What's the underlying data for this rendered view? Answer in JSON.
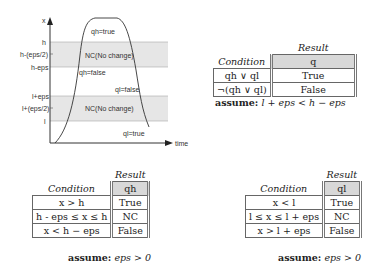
{
  "diagram": {
    "y_axis_label": "x",
    "x_axis_label": "time",
    "levels": [
      "h",
      "h-(eps/2)",
      "h-eps",
      "l+eps",
      "l+(eps/2)",
      "l"
    ],
    "band_labels": [
      "NC(No change)",
      "NC(No change)"
    ],
    "region_labels": [
      "qh=true",
      "qh=false",
      "ql=false",
      "ql=true"
    ]
  },
  "table_q": {
    "result_title": "Result",
    "condition_header": "Condition",
    "result_header": "q",
    "rows": [
      {
        "condition": "qh ∨ ql",
        "result": "True"
      },
      {
        "condition": "¬(qh ∨ ql)",
        "result": "False"
      }
    ],
    "assume_keyword": "assume:",
    "assume_expr": "l + eps < h − eps"
  },
  "table_qh": {
    "result_title": "Result",
    "condition_header": "Condition",
    "result_header": "qh",
    "rows": [
      {
        "condition": "x > h",
        "result": "True"
      },
      {
        "condition": "h - eps ≤ x ≤ h",
        "result": "NC"
      },
      {
        "condition": "x < h − eps",
        "result": "False"
      }
    ],
    "assume_keyword": "assume:",
    "assume_expr": "eps > 0"
  },
  "table_ql": {
    "result_title": "Result",
    "condition_header": "Condition",
    "result_header": "ql",
    "rows": [
      {
        "condition": "x < l",
        "result": "True"
      },
      {
        "condition": "l ≤ x ≤ l + eps",
        "result": "NC"
      },
      {
        "condition": "x > l + eps",
        "result": "False"
      }
    ],
    "assume_keyword": "assume:",
    "assume_expr": "eps > 0"
  }
}
